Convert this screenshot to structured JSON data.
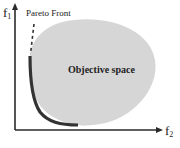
{
  "diagram": {
    "axes": {
      "y": {
        "symbol": "f",
        "subscript": "1"
      },
      "x": {
        "symbol": "f",
        "subscript": "2"
      }
    },
    "labels": {
      "pareto_front": "Pareto Front",
      "objective_space": "Objective space"
    },
    "colors": {
      "axis": "#2a2a2a",
      "objective_space_fill": "#d6d6d6",
      "pareto_curve": "#333333",
      "text": "#222222",
      "background": "#ffffff"
    }
  }
}
